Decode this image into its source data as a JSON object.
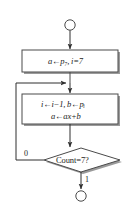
{
  "diagram": {
    "type": "flowchart",
    "colors": {
      "stroke": "#4a4a4a",
      "shadow": "#9a9a9a",
      "fill": "#ffffff",
      "text": "#1c1c1c",
      "background": "#ffffff"
    },
    "nodes": {
      "start_terminal": {
        "shape": "circle",
        "label": ""
      },
      "init_box": {
        "shape": "process",
        "lines": [
          "a←p₇, i=7"
        ]
      },
      "loop_box": {
        "shape": "process",
        "lines": [
          "i←i−1, b←pᵢ",
          "a←ax+b"
        ]
      },
      "decision": {
        "shape": "diamond",
        "label": "Count=7?"
      },
      "end_terminal": {
        "shape": "circle",
        "label": ""
      }
    },
    "edges": {
      "false_branch_label": "0",
      "true_branch_label": "1"
    }
  }
}
